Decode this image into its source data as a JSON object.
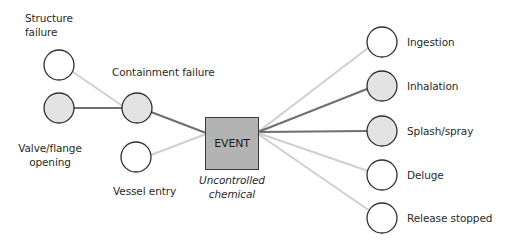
{
  "diagram": {
    "colors": {
      "node_stroke": "#2f2f2f",
      "node_fill_shaded": "#e3e3e3",
      "node_fill_empty": "#ffffff",
      "edge_dark": "#6e6e6e",
      "edge_light": "#cfcfcf",
      "event_fill": "#b3b3b3"
    },
    "event": {
      "label": "EVENT",
      "caption_line1": "Uncontrolled",
      "caption_line2": "chemical"
    },
    "causes": [
      {
        "id": "structure",
        "label_line1": "Structure",
        "label_line2": "failure",
        "shaded": false
      },
      {
        "id": "valve",
        "label_line1": "Valve/flange",
        "label_line2": "opening",
        "shaded": true
      },
      {
        "id": "containment",
        "label_line1": "Containment failure",
        "label_line2": "",
        "shaded": true
      },
      {
        "id": "vessel",
        "label_line1": "Vessel entry",
        "label_line2": "",
        "shaded": false
      }
    ],
    "outcomes": [
      {
        "id": "ingestion",
        "label": "Ingestion",
        "shaded": false
      },
      {
        "id": "inhalation",
        "label": "Inhalation",
        "shaded": true
      },
      {
        "id": "splash",
        "label": "Splash/spray",
        "shaded": true
      },
      {
        "id": "deluge",
        "label": "Deluge",
        "shaded": false
      },
      {
        "id": "release",
        "label": "Release stopped",
        "shaded": false
      }
    ]
  }
}
